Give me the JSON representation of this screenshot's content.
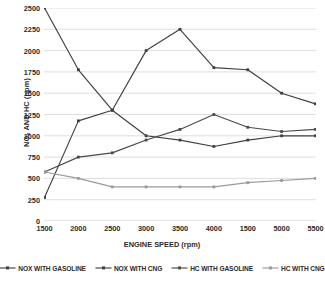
{
  "chart_data": {
    "type": "line",
    "title": "",
    "xlabel": "ENGINE SPEED (rpm)",
    "ylabel": "NOx AND HC (ppm)",
    "ylabel_main": "NO",
    "ylabel_sub": "x",
    "ylabel_rest": " AND HC (ppm)",
    "categories": [
      "1500",
      "2000",
      "2500",
      "3000",
      "3500",
      "4000",
      "1500",
      "5000",
      "5500"
    ],
    "x_tick_labels": [
      "1500",
      "2000",
      "2500",
      "3000",
      "3500",
      "4000",
      "1500",
      "5000",
      "5500"
    ],
    "y_tick_labels": [
      "0",
      "250",
      "500",
      "750",
      "1000",
      "1250",
      "1500",
      "1750",
      "2000",
      "2250",
      "2500"
    ],
    "y_ticks": [
      0,
      250,
      500,
      750,
      1000,
      1250,
      1500,
      1750,
      2000,
      2250,
      2500
    ],
    "ylim": [
      0,
      2500
    ],
    "grid": true,
    "grid_axis": "y",
    "legend_position": "bottom",
    "series": [
      {
        "name": "NOX WITH GASOLINE",
        "color": "#3f3f3f",
        "marker": "square",
        "values": [
          2500,
          1775,
          1300,
          1000,
          950,
          875,
          950,
          1000,
          1000
        ]
      },
      {
        "name": "NOX WITH CNG",
        "color": "#3f3f3f",
        "marker": "square",
        "values": [
          275,
          1175,
          1300,
          2000,
          2250,
          1800,
          1775,
          1500,
          1375
        ]
      },
      {
        "name": "HC WITH GASOLINE",
        "color": "#4a4a4a",
        "marker": "square",
        "values": [
          575,
          750,
          800,
          950,
          1075,
          1250,
          1100,
          1050,
          1075
        ]
      },
      {
        "name": "HC WITH CNG",
        "color": "#9a9a9a",
        "marker": "square",
        "values": [
          575,
          500,
          400,
          400,
          400,
          400,
          450,
          475,
          500
        ]
      }
    ]
  },
  "legend": {
    "items": [
      {
        "label": "NOX WITH GASOLINE"
      },
      {
        "label": "NOX WITH CNG"
      },
      {
        "label": "HC WITH GASOLINE"
      },
      {
        "label": "HC WITH CNG"
      }
    ]
  },
  "colors": {
    "grid": "#d6d6d6",
    "axis": "#c9c9c9",
    "text": "#2b2b2b",
    "series_dark": "#3f3f3f",
    "series_light": "#9a9a9a",
    "background": "#ffffff"
  }
}
